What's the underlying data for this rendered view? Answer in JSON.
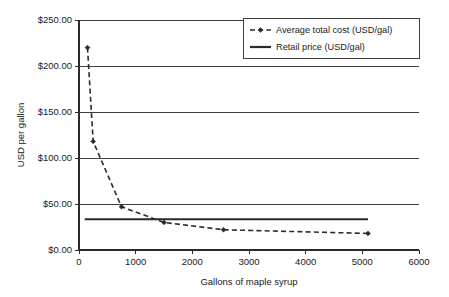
{
  "chart_data": {
    "type": "line",
    "title": "",
    "xlabel": "Gallons of maple syrup",
    "ylabel": "USD per gallon",
    "xlim": [
      0,
      6000
    ],
    "ylim": [
      0,
      250
    ],
    "grid": "horizontal",
    "legend_position": "top-right",
    "x_ticks": [
      "0",
      "1000",
      "2000",
      "3000",
      "4000",
      "5000",
      "6000"
    ],
    "x_tick_values": [
      0,
      1000,
      2000,
      3000,
      4000,
      5000,
      6000
    ],
    "y_ticks": [
      "$0.00",
      "$50.00",
      "$100.00",
      "$150.00",
      "$200.00",
      "$250.00"
    ],
    "y_tick_values": [
      0,
      50,
      100,
      150,
      200,
      250
    ],
    "series": [
      {
        "name": "Average total cost (USD/gal)",
        "style": "dashed-with-markers",
        "marker": "diamond",
        "color": "#2b2b2b",
        "x": [
          150,
          250,
          750,
          1500,
          2550,
          5100
        ],
        "values": [
          220,
          118,
          47,
          30,
          22,
          18
        ]
      },
      {
        "name": "Retail price (USD/gal)",
        "style": "solid",
        "marker": "none",
        "color": "#2b2b2b",
        "x": [
          100,
          5100
        ],
        "values": [
          33.5,
          33.5
        ]
      }
    ]
  },
  "legend": {
    "entries": [
      {
        "label": "Average total cost (USD/gal)"
      },
      {
        "label": "Retail price (USD/gal)"
      }
    ]
  }
}
